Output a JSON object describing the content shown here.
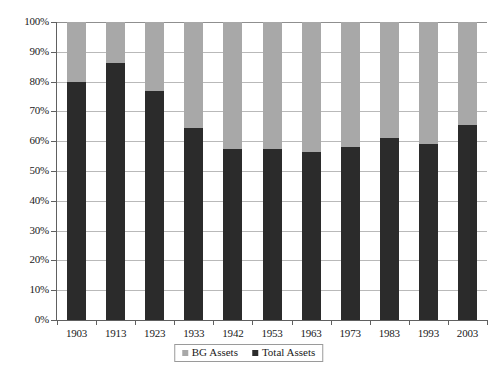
{
  "chart_data": {
    "type": "bar",
    "subtype": "stacked-100-percent",
    "title": "",
    "xlabel": "",
    "ylabel": "",
    "categories": [
      "1903",
      "1913",
      "1923",
      "1933",
      "1942",
      "1953",
      "1963",
      "1973",
      "1983",
      "1993",
      "2003"
    ],
    "series": [
      {
        "name": "Total Assets",
        "color": "#2b2b2b",
        "values": [
          79.8,
          86.2,
          77.0,
          64.5,
          57.5,
          57.5,
          56.5,
          58.0,
          61.0,
          59.0,
          65.5
        ]
      },
      {
        "name": "BG Assets",
        "color": "#a8a8a8",
        "values": [
          20.2,
          13.8,
          23.0,
          35.5,
          42.5,
          42.5,
          43.5,
          42.0,
          39.0,
          41.0,
          34.5
        ]
      }
    ],
    "ylim": [
      0,
      100
    ],
    "ytick_labels": [
      "0%",
      "10%",
      "20%",
      "30%",
      "40%",
      "50%",
      "60%",
      "70%",
      "80%",
      "90%",
      "100%"
    ],
    "ytick_values": [
      0,
      10,
      20,
      30,
      40,
      50,
      60,
      70,
      80,
      90,
      100
    ],
    "grid": true,
    "legend_position": "bottom",
    "legend_entries": [
      {
        "label": "BG Assets",
        "color": "#a8a8a8"
      },
      {
        "label": "Total Assets",
        "color": "#2b2b2b"
      }
    ]
  },
  "colors": {
    "bg_assets": "#a8a8a8",
    "total_assets": "#2b2b2b",
    "gridline": "#b9b9b9",
    "axis": "#606060",
    "background": "#ffffff"
  }
}
